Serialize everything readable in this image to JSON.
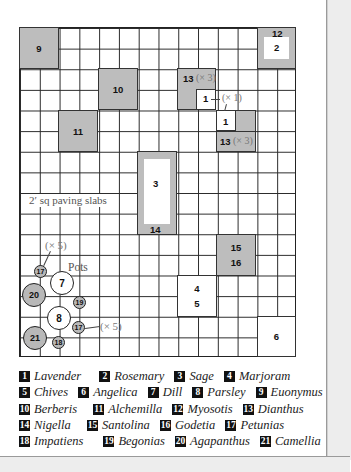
{
  "plan": {
    "paving_label": "2′ sq paving slabs",
    "pots_label": "Pots",
    "beds": {
      "b9": "9",
      "b12": "12",
      "b2": "2",
      "b10": "10",
      "b11": "11",
      "b13_top": "13",
      "b13_top_note": "(× 3)",
      "b1_a": "1",
      "b1_note": "(× 1)",
      "b1_b": "1",
      "b13_bottom": "13",
      "b13_bottom_note": "(× 3)",
      "b3": "3",
      "b14": "14",
      "b15": "15",
      "b16": "16",
      "b4": "4",
      "b5": "5",
      "b6": "6"
    },
    "pots": {
      "p17a": "17",
      "p17a_note": "(× 5)",
      "p7": "7",
      "p20": "20",
      "p19": "19",
      "p8": "8",
      "p17b": "17",
      "p17b_note": "(× 5)",
      "p21": "21",
      "p18": "18"
    }
  },
  "legend": {
    "rows": [
      [
        {
          "n": "1",
          "name": "Lavender"
        },
        {
          "n": "2",
          "name": "Rosemary"
        },
        {
          "n": "3",
          "name": "Sage"
        },
        {
          "n": "4",
          "name": "Marjoram"
        }
      ],
      [
        {
          "n": "5",
          "name": "Chives"
        },
        {
          "n": "6",
          "name": "Angelica"
        },
        {
          "n": "7",
          "name": "Dill"
        },
        {
          "n": "8",
          "name": "Parsley"
        },
        {
          "n": "9",
          "name": "Euonymus"
        }
      ],
      [
        {
          "n": "10",
          "name": "Berberis"
        },
        {
          "n": "11",
          "name": "Alchemilla"
        },
        {
          "n": "12",
          "name": "Myosotis"
        },
        {
          "n": "13",
          "name": "Dianthus"
        }
      ],
      [
        {
          "n": "14",
          "name": "Nigella"
        },
        {
          "n": "15",
          "name": "Santolina"
        },
        {
          "n": "16",
          "name": "Godetia"
        },
        {
          "n": "17",
          "name": "Petunias"
        }
      ],
      [
        {
          "n": "18",
          "name": "Impatiens"
        },
        {
          "n": "19",
          "name": "Begonias"
        },
        {
          "n": "20",
          "name": "Agapanthus"
        },
        {
          "n": "21",
          "name": "Camellia"
        }
      ]
    ]
  },
  "colors": {
    "bed_fill": "#bdbdbd",
    "grid_line": "#2a2a2a",
    "legend_badge": "#111111"
  }
}
